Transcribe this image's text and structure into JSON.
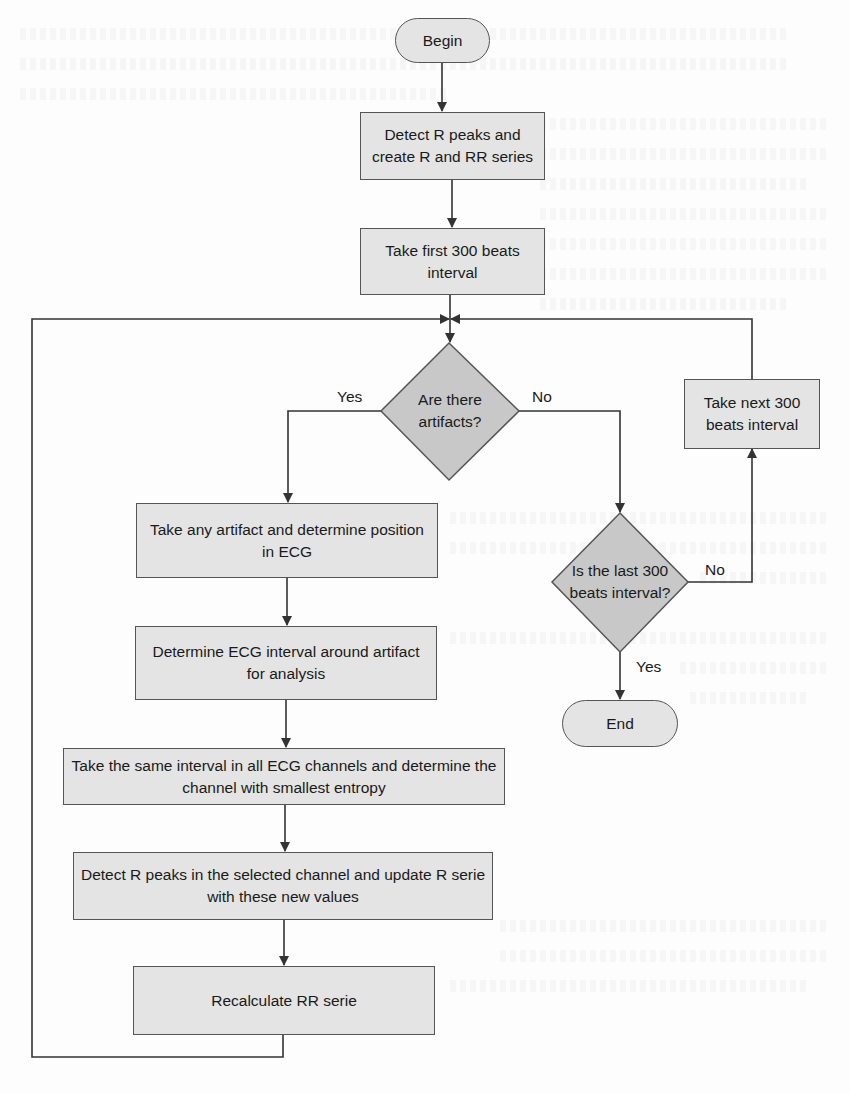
{
  "colors": {
    "process_fill": "#e4e4e4",
    "decision_fill": "#c8c8c8",
    "stroke": "#444444",
    "text": "#1a1a1a"
  },
  "nodes": {
    "begin": "Begin",
    "detect_r_peaks": "Detect R peaks and create R and RR series",
    "take_first": "Take first 300 beats interval",
    "are_there_artifacts": "Are there artifacts?",
    "take_next": "Take next 300 beats interval",
    "take_any_artifact": "Take any artifact and determine position in ECG",
    "determine_interval": "Determine ECG interval around artifact for analysis",
    "take_same_interval": "Take the same interval in all ECG channels and determine the channel with smallest entropy",
    "detect_selected": "Detect R peaks in the selected channel and update R serie with these new values",
    "recalculate_rr": "Recalculate RR serie",
    "is_last_interval": "Is the last 300 beats interval?",
    "end": "End"
  },
  "edge_labels": {
    "artifacts_yes": "Yes",
    "artifacts_no": "No",
    "last_no": "No",
    "last_yes": "Yes"
  }
}
